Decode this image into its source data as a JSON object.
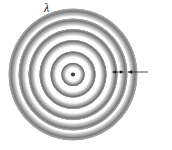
{
  "figure": {
    "background_color": "#ffffff",
    "width": 172,
    "height": 150
  },
  "wave_pattern": {
    "name": "circular-wavefronts",
    "source": {
      "name": "point-source",
      "label": "",
      "dot_color": "#3a3a3a",
      "dot_diameter_px": 4,
      "center_x_px": 73,
      "center_y_px": 74
    },
    "ring_count": 6,
    "ring_shading": "dark outer edge fading to white toward center",
    "ring_dark_color": "#6e6e6e",
    "ring_light_color": "#ffffff",
    "ring_outline_color": "#8a8a8a",
    "rings": [
      {
        "index": 1,
        "radius_rx_px": 11,
        "radius_ry_px": 11,
        "thickness_px": 6
      },
      {
        "index": 2,
        "radius_rx_px": 22,
        "radius_ry_px": 22,
        "thickness_px": 7
      },
      {
        "index": 3,
        "radius_rx_px": 33,
        "radius_ry_px": 34,
        "thickness_px": 7
      },
      {
        "index": 4,
        "radius_rx_px": 44,
        "radius_ry_px": 45,
        "thickness_px": 8
      },
      {
        "index": 5,
        "radius_rx_px": 54,
        "radius_ry_px": 56,
        "thickness_px": 8
      },
      {
        "index": 6,
        "radius_rx_px": 64,
        "radius_ry_px": 66,
        "thickness_px": 8
      }
    ]
  },
  "annotation": {
    "name": "wavelength-callout",
    "symbol": "λ",
    "meaning": "wavelength",
    "span_arrow": {
      "name": "wavelength-span-arrow",
      "style": "double-headed",
      "measures": "spacing between two adjacent wavefronts"
    },
    "pointer_arrow": {
      "name": "lambda-pointer-arrow",
      "style": "single-headed",
      "direction": "left"
    },
    "color": "#1c1c1c"
  }
}
